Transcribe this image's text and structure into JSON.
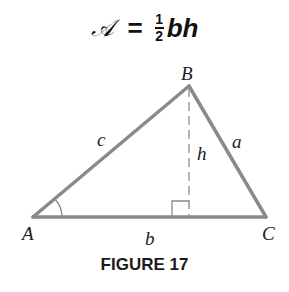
{
  "formula": {
    "lhs": "𝒜",
    "equals": "=",
    "fraction_numerator": "1",
    "fraction_denominator": "2",
    "rhs_vars": "bh"
  },
  "diagram": {
    "vertices": {
      "A": {
        "label": "A",
        "x": 33,
        "y": 217
      },
      "B": {
        "label": "B",
        "x": 189,
        "y": 86
      },
      "C": {
        "label": "C",
        "x": 266,
        "y": 217
      }
    },
    "side_labels": {
      "a": "a",
      "b": "b",
      "c": "c"
    },
    "altitude_label": "h",
    "line_color": "#8a8a8a",
    "altitude_style": "dashed",
    "right_angle_marker": true,
    "angle_arc_at": "A"
  },
  "caption": "FIGURE 17"
}
